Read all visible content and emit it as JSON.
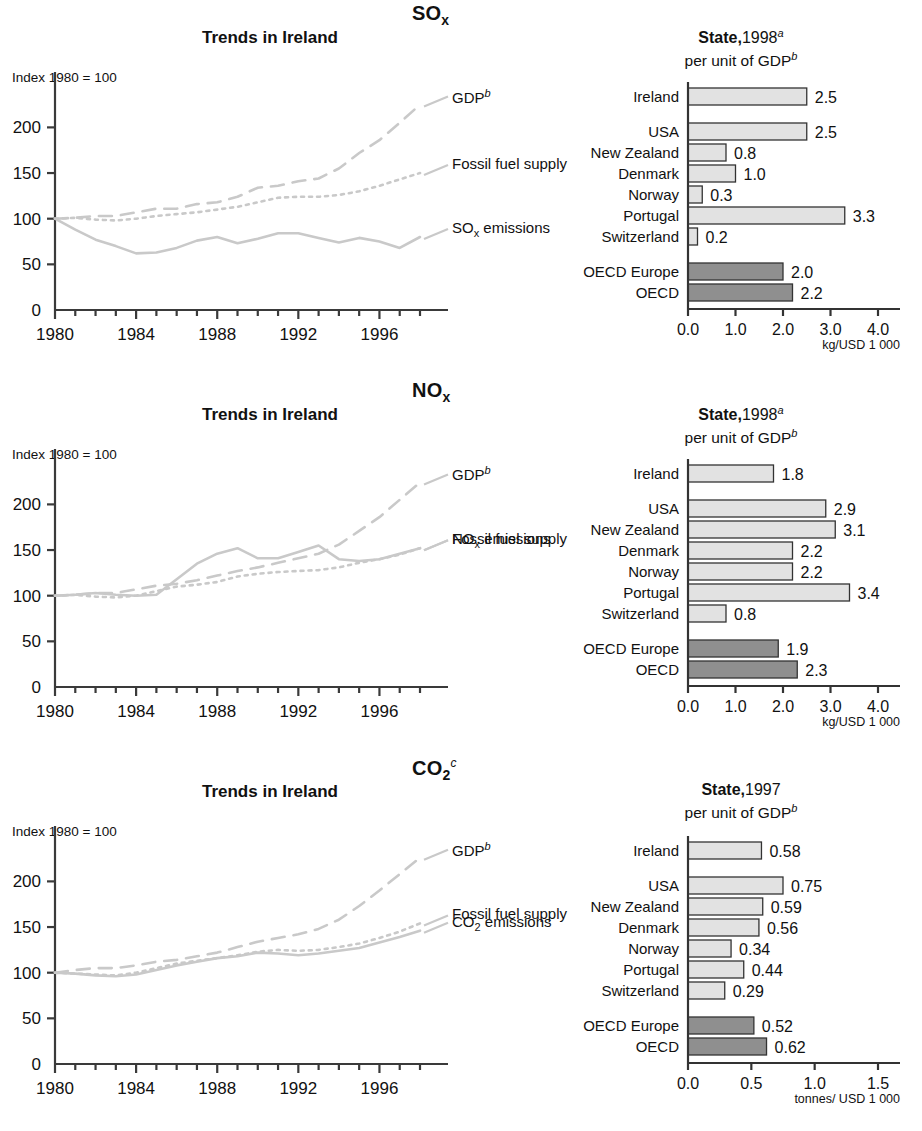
{
  "colors": {
    "line": "#c9c9c9",
    "bar_country": "#e2e2e2",
    "bar_oecd": "#8f8f8f",
    "axis": "#3a3a3a",
    "text": "#1a1a1a"
  },
  "panels": [
    {
      "pollutant": "SO",
      "pollutant_sub": "x",
      "pollutant_sup": "",
      "trends": {
        "title": "Trends in Ireland",
        "index_label": "Index 1980 = 100",
        "y_ticks": [
          "0",
          "50",
          "100",
          "150",
          "200"
        ],
        "x_ticks": [
          "1980",
          "1984",
          "1988",
          "1992",
          "1996"
        ],
        "series_labels": [
          {
            "text": "GDP",
            "sup": "b"
          },
          {
            "text": "Fossil fuel supply",
            "sup": ""
          },
          {
            "text": "SO",
            "sub": "x",
            "tail": " emissions"
          }
        ]
      },
      "bars": {
        "title_bold": "State,",
        "title_year": "1998",
        "title_sup": "a",
        "title_line2": "per unit of GDP",
        "title_line2_sup": "b",
        "unit": "kg/USD 1 000",
        "x_ticks": [
          "0.0",
          "1.0",
          "2.0",
          "3.0",
          "4.0"
        ],
        "x_max": 4.0,
        "items": [
          {
            "label": "Ireland",
            "value": 2.5,
            "display": "2.5",
            "group": "focus"
          },
          {
            "label": "USA",
            "value": 2.5,
            "display": "2.5",
            "group": "country"
          },
          {
            "label": "New Zealand",
            "value": 0.8,
            "display": "0.8",
            "group": "country"
          },
          {
            "label": "Denmark",
            "value": 1.0,
            "display": "1.0",
            "group": "country"
          },
          {
            "label": "Norway",
            "value": 0.3,
            "display": "0.3",
            "group": "country"
          },
          {
            "label": "Portugal",
            "value": 3.3,
            "display": "3.3",
            "group": "country"
          },
          {
            "label": "Switzerland",
            "value": 0.2,
            "display": "0.2",
            "group": "country"
          },
          {
            "label": "OECD Europe",
            "value": 2.0,
            "display": "2.0",
            "group": "oecd"
          },
          {
            "label": "OECD",
            "value": 2.2,
            "display": "2.2",
            "group": "oecd"
          }
        ]
      }
    },
    {
      "pollutant": "NO",
      "pollutant_sub": "x",
      "pollutant_sup": "",
      "trends": {
        "title": "Trends in Ireland",
        "index_label": "Index 1980 = 100",
        "y_ticks": [
          "0",
          "50",
          "100",
          "150",
          "200"
        ],
        "x_ticks": [
          "1980",
          "1984",
          "1988",
          "1992",
          "1996"
        ],
        "series_labels": [
          {
            "text": "GDP",
            "sup": "b"
          },
          {
            "text": "Fossil fuel supply",
            "sup": ""
          },
          {
            "text": "NO",
            "sub": "x",
            "tail": " emissions"
          }
        ]
      },
      "bars": {
        "title_bold": "State,",
        "title_year": "1998",
        "title_sup": "a",
        "title_line2": "per unit of GDP",
        "title_line2_sup": "b",
        "unit": "kg/USD 1 000",
        "x_ticks": [
          "0.0",
          "1.0",
          "2.0",
          "3.0",
          "4.0"
        ],
        "x_max": 4.0,
        "items": [
          {
            "label": "Ireland",
            "value": 1.8,
            "display": "1.8",
            "group": "focus"
          },
          {
            "label": "USA",
            "value": 2.9,
            "display": "2.9",
            "group": "country"
          },
          {
            "label": "New Zealand",
            "value": 3.1,
            "display": "3.1",
            "group": "country"
          },
          {
            "label": "Denmark",
            "value": 2.2,
            "display": "2.2",
            "group": "country"
          },
          {
            "label": "Norway",
            "value": 2.2,
            "display": "2.2",
            "group": "country"
          },
          {
            "label": "Portugal",
            "value": 3.4,
            "display": "3.4",
            "group": "country"
          },
          {
            "label": "Switzerland",
            "value": 0.8,
            "display": "0.8",
            "group": "country"
          },
          {
            "label": "OECD Europe",
            "value": 1.9,
            "display": "1.9",
            "group": "oecd"
          },
          {
            "label": "OECD",
            "value": 2.3,
            "display": "2.3",
            "group": "oecd"
          }
        ]
      }
    },
    {
      "pollutant": "CO",
      "pollutant_sub": "2",
      "pollutant_sup": "c",
      "trends": {
        "title": "Trends in Ireland",
        "index_label": "Index 1980 = 100",
        "y_ticks": [
          "0",
          "50",
          "100",
          "150",
          "200"
        ],
        "x_ticks": [
          "1980",
          "1984",
          "1988",
          "1992",
          "1996"
        ],
        "series_labels": [
          {
            "text": "GDP",
            "sup": "b"
          },
          {
            "text": "Fossil fuel supply",
            "sup": ""
          },
          {
            "text": "CO",
            "sub": "2",
            "tail": " emissions"
          }
        ]
      },
      "bars": {
        "title_bold": "State,",
        "title_year": "1997",
        "title_sup": "",
        "title_line2": "per unit of GDP",
        "title_line2_sup": "b",
        "unit": "tonnes/ USD 1 000",
        "x_ticks": [
          "0.0",
          "0.5",
          "1.0",
          "1.5"
        ],
        "x_max": 1.5,
        "items": [
          {
            "label": "Ireland",
            "value": 0.58,
            "display": "0.58",
            "group": "focus"
          },
          {
            "label": "USA",
            "value": 0.75,
            "display": "0.75",
            "group": "country"
          },
          {
            "label": "New Zealand",
            "value": 0.59,
            "display": "0.59",
            "group": "country"
          },
          {
            "label": "Denmark",
            "value": 0.56,
            "display": "0.56",
            "group": "country"
          },
          {
            "label": "Norway",
            "value": 0.34,
            "display": "0.34",
            "group": "country"
          },
          {
            "label": "Portugal",
            "value": 0.44,
            "display": "0.44",
            "group": "country"
          },
          {
            "label": "Switzerland",
            "value": 0.29,
            "display": "0.29",
            "group": "country"
          },
          {
            "label": "OECD Europe",
            "value": 0.52,
            "display": "0.52",
            "group": "oecd"
          },
          {
            "label": "OECD",
            "value": 0.62,
            "display": "0.62",
            "group": "oecd"
          }
        ]
      }
    }
  ],
  "chart_data": [
    {
      "type": "line",
      "title": "SOx - Trends in Ireland",
      "ylabel": "Index 1980 = 100",
      "xlabel": "",
      "ylim": [
        0,
        230
      ],
      "xlim": [
        1980,
        1998
      ],
      "x": [
        1980,
        1981,
        1982,
        1983,
        1984,
        1985,
        1986,
        1987,
        1988,
        1989,
        1990,
        1991,
        1992,
        1993,
        1994,
        1995,
        1996,
        1997,
        1998
      ],
      "series": [
        {
          "name": "GDP",
          "style": "dashed",
          "values": [
            100,
            101,
            103,
            103,
            107,
            111,
            111,
            116,
            118,
            124,
            134,
            136,
            141,
            144,
            155,
            172,
            186,
            205,
            225
          ]
        },
        {
          "name": "Fossil fuel supply",
          "style": "dotted",
          "values": [
            100,
            101,
            99,
            98,
            100,
            103,
            105,
            107,
            110,
            113,
            118,
            123,
            124,
            124,
            126,
            130,
            136,
            143,
            150
          ]
        },
        {
          "name": "SOx emissions",
          "style": "solid",
          "values": [
            100,
            88,
            77,
            70,
            62,
            63,
            68,
            76,
            80,
            73,
            78,
            84,
            84,
            79,
            74,
            79,
            75,
            68,
            80
          ]
        }
      ]
    },
    {
      "type": "bar",
      "orientation": "horizontal",
      "title": "SOx State, 1998 per unit of GDP",
      "xlabel": "kg/USD 1 000",
      "xlim": [
        0,
        4.0
      ],
      "categories": [
        "Ireland",
        "USA",
        "New Zealand",
        "Denmark",
        "Norway",
        "Portugal",
        "Switzerland",
        "OECD Europe",
        "OECD"
      ],
      "values": [
        2.5,
        2.5,
        0.8,
        1.0,
        0.3,
        3.3,
        0.2,
        2.0,
        2.2
      ]
    },
    {
      "type": "line",
      "title": "NOx - Trends in Ireland",
      "ylabel": "Index 1980 = 100",
      "xlabel": "",
      "ylim": [
        0,
        230
      ],
      "xlim": [
        1980,
        1998
      ],
      "x": [
        1980,
        1981,
        1982,
        1983,
        1984,
        1985,
        1986,
        1987,
        1988,
        1989,
        1990,
        1991,
        1992,
        1993,
        1994,
        1995,
        1996,
        1997,
        1998
      ],
      "series": [
        {
          "name": "GDP",
          "style": "dashed",
          "values": [
            100,
            101,
            103,
            103,
            107,
            111,
            113,
            117,
            122,
            127,
            131,
            136,
            141,
            146,
            156,
            171,
            186,
            205,
            224
          ]
        },
        {
          "name": "Fossil fuel supply",
          "style": "dotted",
          "values": [
            100,
            101,
            99,
            98,
            100,
            105,
            110,
            112,
            115,
            121,
            124,
            126,
            127,
            128,
            131,
            136,
            140,
            145,
            152
          ]
        },
        {
          "name": "NOx emissions",
          "style": "solid",
          "values": [
            100,
            101,
            103,
            101,
            100,
            101,
            118,
            135,
            146,
            152,
            141,
            141,
            148,
            155,
            140,
            138,
            140,
            146,
            152
          ]
        }
      ]
    },
    {
      "type": "bar",
      "orientation": "horizontal",
      "title": "NOx State, 1998 per unit of GDP",
      "xlabel": "kg/USD 1 000",
      "xlim": [
        0,
        4.0
      ],
      "categories": [
        "Ireland",
        "USA",
        "New Zealand",
        "Denmark",
        "Norway",
        "Portugal",
        "Switzerland",
        "OECD Europe",
        "OECD"
      ],
      "values": [
        1.8,
        2.9,
        3.1,
        2.2,
        2.2,
        3.4,
        0.8,
        1.9,
        2.3
      ]
    },
    {
      "type": "line",
      "title": "CO2 - Trends in Ireland",
      "ylabel": "Index 1980 = 100",
      "xlabel": "",
      "ylim": [
        0,
        230
      ],
      "xlim": [
        1980,
        1998
      ],
      "x": [
        1980,
        1981,
        1982,
        1983,
        1984,
        1985,
        1986,
        1987,
        1988,
        1989,
        1990,
        1991,
        1992,
        1993,
        1994,
        1995,
        1996,
        1997,
        1998
      ],
      "series": [
        {
          "name": "GDP",
          "style": "dashed",
          "values": [
            100,
            103,
            105,
            105,
            108,
            112,
            114,
            118,
            122,
            128,
            134,
            138,
            142,
            148,
            158,
            173,
            190,
            208,
            226
          ]
        },
        {
          "name": "Fossil fuel supply",
          "style": "dotted",
          "values": [
            100,
            99,
            98,
            97,
            100,
            105,
            110,
            113,
            116,
            119,
            123,
            125,
            124,
            125,
            128,
            132,
            138,
            145,
            154
          ]
        },
        {
          "name": "CO2 emissions",
          "style": "solid",
          "values": [
            100,
            99,
            97,
            96,
            98,
            103,
            108,
            112,
            116,
            118,
            122,
            121,
            119,
            121,
            124,
            127,
            133,
            139,
            146
          ]
        }
      ]
    },
    {
      "type": "bar",
      "orientation": "horizontal",
      "title": "CO2 State, 1997 per unit of GDP",
      "xlabel": "tonnes/ USD 1 000",
      "xlim": [
        0,
        1.5
      ],
      "categories": [
        "Ireland",
        "USA",
        "New Zealand",
        "Denmark",
        "Norway",
        "Portugal",
        "Switzerland",
        "OECD Europe",
        "OECD"
      ],
      "values": [
        0.58,
        0.75,
        0.59,
        0.56,
        0.34,
        0.44,
        0.29,
        0.52,
        0.62
      ]
    }
  ]
}
